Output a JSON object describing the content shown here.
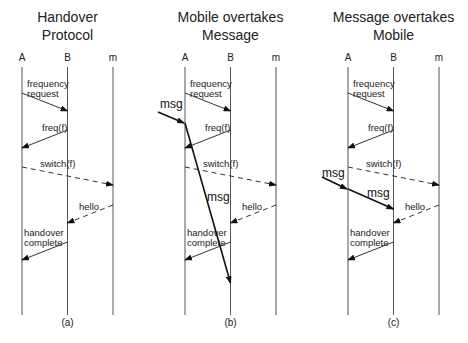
{
  "panels": [
    {
      "id": "a",
      "title_lines": [
        "Handover",
        "Protocol"
      ],
      "caption": "(a)",
      "lifelines": [
        "A",
        "B",
        "m"
      ],
      "messages": [
        {
          "label_lines": [
            "frequency",
            "request"
          ],
          "from": "A",
          "to": "B",
          "style": "solid"
        },
        {
          "label_lines": [
            "freq(f)"
          ],
          "from": "B",
          "to": "A",
          "style": "solid"
        },
        {
          "label_lines": [
            "switch(f)"
          ],
          "from": "A",
          "to": "m",
          "style": "dashed"
        },
        {
          "label_lines": [
            "hello"
          ],
          "from": "m",
          "to": "B",
          "style": "dashed"
        },
        {
          "label_lines": [
            "handover",
            "complete"
          ],
          "from": "B",
          "to": "A",
          "style": "solid"
        }
      ],
      "data_message": null
    },
    {
      "id": "b",
      "title_lines": [
        "Mobile overtakes",
        "Message"
      ],
      "caption": "(b)",
      "lifelines": [
        "A",
        "B",
        "m"
      ],
      "messages": [
        {
          "label_lines": [
            "frequency",
            "request"
          ],
          "from": "A",
          "to": "B",
          "style": "solid"
        },
        {
          "label_lines": [
            "freq(f)"
          ],
          "from": "B",
          "to": "A",
          "style": "solid"
        },
        {
          "label_lines": [
            "switch(f)"
          ],
          "from": "A",
          "to": "m",
          "style": "dashed"
        },
        {
          "label_lines": [
            "hello"
          ],
          "from": "m",
          "to": "B",
          "style": "dashed"
        },
        {
          "label_lines": [
            "handover",
            "complete"
          ],
          "from": "B",
          "to": "A",
          "style": "solid"
        }
      ],
      "data_message": {
        "incoming_label": "msg",
        "forward_label": "msg",
        "forwarded_to": "B",
        "arrives": "after handover complete"
      }
    },
    {
      "id": "c",
      "title_lines": [
        "Message overtakes",
        "Mobile"
      ],
      "caption": "(c)",
      "lifelines": [
        "A",
        "B",
        "m"
      ],
      "messages": [
        {
          "label_lines": [
            "frequency",
            "request"
          ],
          "from": "A",
          "to": "B",
          "style": "solid"
        },
        {
          "label_lines": [
            "freq(f)"
          ],
          "from": "B",
          "to": "A",
          "style": "solid"
        },
        {
          "label_lines": [
            "switch(f)"
          ],
          "from": "A",
          "to": "m",
          "style": "dashed"
        },
        {
          "label_lines": [
            "hello"
          ],
          "from": "m",
          "to": "B",
          "style": "dashed"
        },
        {
          "label_lines": [
            "handover",
            "complete"
          ],
          "from": "B",
          "to": "A",
          "style": "solid"
        }
      ],
      "data_message": {
        "incoming_label": "msg",
        "forward_label": "msg",
        "forwarded_to": "B",
        "arrives": "before hello"
      }
    }
  ]
}
